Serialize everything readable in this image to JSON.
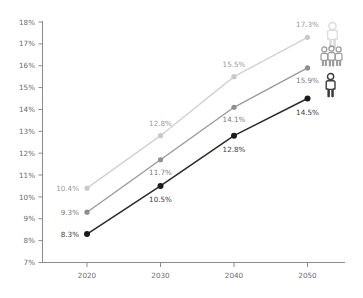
{
  "chart_data": {
    "type": "line",
    "title": "",
    "subtitle": "",
    "xlabel": "",
    "ylabel": "",
    "categories": [
      "2020",
      "2030",
      "2040",
      "2050"
    ],
    "x": [
      2020,
      2030,
      2040,
      2050
    ],
    "ylim": [
      7,
      18
    ],
    "xlim": [
      2020,
      2050
    ],
    "ytick_labels": [
      "18%",
      "17%",
      "16%",
      "15%",
      "14%",
      "13%",
      "12%",
      "11%",
      "10%",
      "9%",
      "8%",
      "7%"
    ],
    "ytick_values": [
      18,
      17,
      16,
      15,
      14,
      13,
      12,
      11,
      10,
      9,
      8,
      7
    ],
    "grid": false,
    "legend_position": "right",
    "series": [
      {
        "name": "series-light",
        "color": "#d2d2d2",
        "marker_color": "#c9c9c9",
        "label_class": "s0",
        "icon": "person-single-light-icon",
        "values": [
          10.4,
          12.8,
          15.5,
          17.3
        ],
        "labels": [
          "10.4%",
          "12.8%",
          "15.5%",
          "17.3%"
        ]
      },
      {
        "name": "series-medium",
        "color": "#9b9b9b",
        "marker_color": "#8f8f8f",
        "label_class": "s1",
        "icon": "person-group-medium-icon",
        "values": [
          9.3,
          11.7,
          14.1,
          15.9
        ],
        "labels": [
          "9.3%",
          "11.7%",
          "14.1%",
          "15.9%"
        ]
      },
      {
        "name": "series-dark",
        "color": "#2b2b2b",
        "marker_color": "#1a1a1a",
        "label_class": "s2",
        "icon": "person-single-dark-icon",
        "values": [
          8.3,
          10.5,
          12.8,
          14.5
        ],
        "labels": [
          "8.3%",
          "10.5%",
          "12.8%",
          "14.5%"
        ]
      }
    ],
    "axis_color": "#8c8c8c",
    "tick_text_color": "#6b6b6b"
  },
  "legend": {
    "items": [
      {
        "icon": "person-single-light-icon",
        "color": "#d2d2d2"
      },
      {
        "icon": "person-group-medium-icon",
        "color": "#9b9b9b"
      },
      {
        "icon": "person-single-dark-icon",
        "color": "#2b2b2b"
      }
    ]
  }
}
